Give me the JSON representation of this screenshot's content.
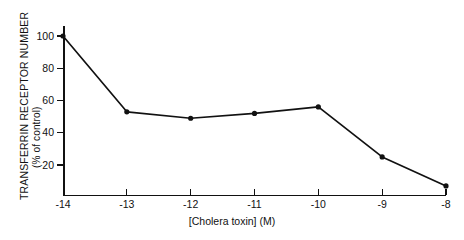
{
  "chart_data": {
    "type": "line",
    "title": "",
    "xlabel": "[Cholera toxin] (M)",
    "ylabel": "TRANSFERRIN RECEPTOR NUMBER",
    "ylabel_sub": "(% of control)",
    "x": [
      -14,
      -13,
      -12,
      -11,
      -10,
      -9,
      -8
    ],
    "xtick_labels": [
      "-14",
      "-13",
      "-12",
      "-11",
      "-10",
      "-9",
      "-8"
    ],
    "values": [
      100,
      53,
      49,
      52,
      56,
      25,
      7
    ],
    "ytick_values": [
      100,
      80,
      60,
      40,
      20
    ],
    "ytick_labels": [
      "100",
      "80",
      "60",
      "40",
      "20"
    ],
    "ylim": [
      0,
      108
    ],
    "xlim": [
      -14,
      -8
    ],
    "grid": false,
    "legend": false,
    "marker": "filled-circle",
    "line_color": "#111111",
    "marker_color": "#111111",
    "background_color": "#ffffff",
    "series": [
      {
        "name": "Transferrin receptor number",
        "values": [
          100,
          53,
          49,
          52,
          56,
          25,
          7
        ]
      }
    ],
    "points": [
      {
        "x": "-14",
        "y": 100
      },
      {
        "x": "-13",
        "y": 53
      },
      {
        "x": "-12",
        "y": 49
      },
      {
        "x": "-11",
        "y": 52
      },
      {
        "x": "-10",
        "y": 56
      },
      {
        "x": "-9",
        "y": 25
      },
      {
        "x": "-8",
        "y": 7
      }
    ]
  }
}
